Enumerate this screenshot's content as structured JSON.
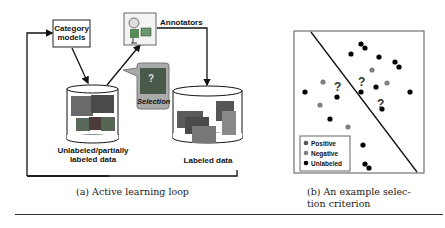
{
  "figure_a": {
    "category_models": "Category\nmodels",
    "category_models_line1": "Category",
    "category_models_line2": "models",
    "annotators": "Annotators",
    "selection": "Selection",
    "selection_mark": "?",
    "unlabeled_line1": "Unlabeled/partially",
    "unlabeled_line2": "labeled data",
    "labeled": "Labeled data",
    "caption": "(a) Active learning loop"
  },
  "figure_b": {
    "question_mark": "?",
    "legend": [
      {
        "label": "Positive",
        "color": "#555555"
      },
      {
        "label": "Negative",
        "color": "#808080"
      },
      {
        "label": "Unlabeled",
        "color": "#000000"
      }
    ],
    "caption_line1": "(b) An example selec-",
    "caption_line2": "tion criterion"
  }
}
